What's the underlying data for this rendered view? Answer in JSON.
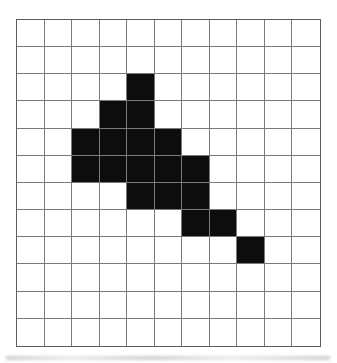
{
  "scene": {
    "description": "Black pixel-art shape shaded on a square grid worksheet figure"
  },
  "grid": {
    "columns": 11,
    "rows": 12,
    "line_color": "#7a7a7a",
    "border_color": "#5c5c5c",
    "cell_background": "#ffffff",
    "fill_color": "#0d0d0d",
    "filled_cells": [
      [
        2,
        4
      ],
      [
        3,
        3
      ],
      [
        3,
        4
      ],
      [
        4,
        2
      ],
      [
        4,
        3
      ],
      [
        4,
        4
      ],
      [
        4,
        5
      ],
      [
        5,
        2
      ],
      [
        5,
        3
      ],
      [
        5,
        4
      ],
      [
        5,
        5
      ],
      [
        5,
        6
      ],
      [
        6,
        4
      ],
      [
        6,
        5
      ],
      [
        6,
        6
      ],
      [
        7,
        6
      ],
      [
        7,
        7
      ],
      [
        8,
        8
      ]
    ]
  },
  "artifacts": {
    "bottom_smudge_color": "#aaaaaa"
  }
}
